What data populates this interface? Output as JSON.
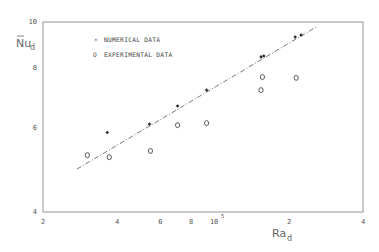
{
  "chart_data": {
    "type": "scatter",
    "title": "",
    "xlabel": "Ra_d",
    "ylabel": "Nu_d (mean)",
    "xscale": "log",
    "yscale": "log",
    "xlim": [
      20000,
      400000
    ],
    "ylim": [
      4,
      10
    ],
    "grid": false,
    "legend_position": "upper-left",
    "x_ticks": [
      {
        "value": 20000,
        "label": "2"
      },
      {
        "value": 40000,
        "label": "4"
      },
      {
        "value": 60000,
        "label": "6"
      },
      {
        "value": 80000,
        "label": "8"
      },
      {
        "value": 100000,
        "label": "10",
        "superscript": "5"
      },
      {
        "value": 200000,
        "label": "2"
      },
      {
        "value": 400000,
        "label": "4"
      }
    ],
    "y_ticks": [
      {
        "value": 4,
        "label": "4"
      },
      {
        "value": 6,
        "label": "6"
      },
      {
        "value": 8,
        "label": "8"
      },
      {
        "value": 10,
        "label": "10"
      }
    ],
    "series": [
      {
        "name": "NUMERICAL DATA",
        "marker": "asterisk",
        "points": [
          {
            "x": 36500,
            "y": 5.87
          },
          {
            "x": 54200,
            "y": 6.11
          },
          {
            "x": 70500,
            "y": 6.67
          },
          {
            "x": 92500,
            "y": 7.2
          },
          {
            "x": 154000,
            "y": 8.45
          },
          {
            "x": 158000,
            "y": 8.49
          },
          {
            "x": 212000,
            "y": 9.3
          },
          {
            "x": 224000,
            "y": 9.39
          }
        ]
      },
      {
        "name": "EXPERIMENTAL DATA",
        "marker": "circle",
        "points": [
          {
            "x": 30300,
            "y": 5.26
          },
          {
            "x": 37200,
            "y": 5.21
          },
          {
            "x": 54700,
            "y": 5.37
          },
          {
            "x": 70500,
            "y": 6.08
          },
          {
            "x": 92500,
            "y": 6.14
          },
          {
            "x": 154000,
            "y": 7.2
          },
          {
            "x": 156000,
            "y": 7.67
          },
          {
            "x": 214000,
            "y": 7.64
          }
        ]
      },
      {
        "name": "correlation fit",
        "type": "line",
        "style": "dash-dot",
        "points": [
          {
            "x": 27500,
            "y": 4.92
          },
          {
            "x": 258000,
            "y": 9.76
          }
        ]
      }
    ]
  },
  "labels": {
    "y_axis_main": "Nu",
    "y_axis_sub": "d",
    "x_axis_main": "Ra",
    "x_axis_sub": "d",
    "legend_numerical": "NUMERICAL DATA",
    "legend_experimental": "EXPERIMENTAL DATA",
    "legend_numerical_symbol": "*",
    "legend_experimental_symbol": "O"
  },
  "colors": {
    "axis": "#888888",
    "marker": "#333333",
    "line": "#555555"
  }
}
